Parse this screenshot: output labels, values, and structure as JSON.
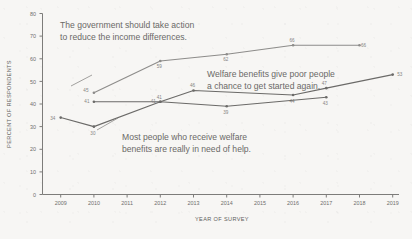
{
  "chart_data": {
    "type": "line",
    "title": "",
    "subtitle": "",
    "xlabel": "YEAR OF SURVEY",
    "ylabel": "PERCENT OF RESPONDENTS",
    "xlim": [
      2008.6,
      2019.4
    ],
    "ylim": [
      0,
      80
    ],
    "ytick_step": 10,
    "grid": false,
    "legend": "none (inline annotations)",
    "xticks": [
      "2009",
      "2010",
      "2011",
      "2012",
      "2013",
      "2014",
      "2015",
      "2016",
      "2017",
      "2018",
      "2019"
    ],
    "yticks": [
      "0",
      "10",
      "20",
      "30",
      "40",
      "50",
      "60",
      "70",
      "80"
    ],
    "series": [
      {
        "name": "The government should take action to reduce the income differences.",
        "color": "#8d8c8a",
        "x": [
          2010,
          2012,
          2014,
          2016,
          2018
        ],
        "values": [
          45,
          59,
          62,
          66,
          66
        ],
        "labels": [
          "45",
          "59",
          "62",
          "66",
          "66"
        ]
      },
      {
        "name": "Welfare benefits give poor people a chance to get started again.",
        "color": "#6b6a68",
        "x": [
          2010,
          2012,
          2013,
          2016,
          2017,
          2019
        ],
        "values": [
          41,
          41,
          46,
          44,
          47,
          53
        ],
        "labels": [
          "41",
          "41",
          "46",
          "44",
          "47",
          "53"
        ]
      },
      {
        "name": "Most people who receive welfare benefits are really in need of help.",
        "color": "#6b6a68",
        "x": [
          2009,
          2010,
          2012,
          2014,
          2017
        ],
        "values": [
          34,
          30,
          41,
          39,
          43
        ],
        "labels": [
          "34",
          "30",
          "41",
          "39",
          "43"
        ]
      }
    ],
    "annotations": [
      {
        "id": "government-action",
        "lines": [
          "The government should take action",
          "to reduce the income differences."
        ]
      },
      {
        "id": "welfare-chance",
        "lines": [
          "Welfare benefits give poor people",
          "a chance to get started again."
        ]
      },
      {
        "id": "need-of-help",
        "lines": [
          "Most people who receive welfare",
          "benefits are really in need of help."
        ]
      }
    ]
  }
}
